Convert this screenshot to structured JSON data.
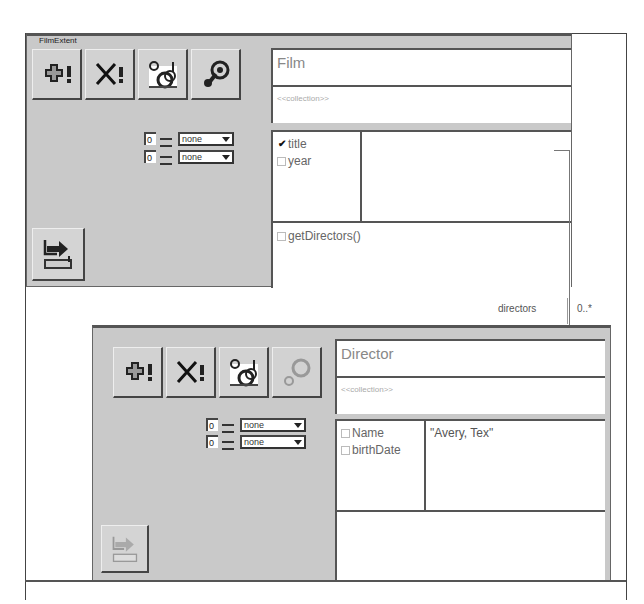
{
  "film_panel": {
    "title": "FilmExtent",
    "toolbar": [
      {
        "name": "add-instance",
        "icon": "plus-exclaim-icon"
      },
      {
        "name": "delete-instance",
        "icon": "x-exclaim-icon"
      },
      {
        "name": "navigate-links",
        "icon": "circles-link-icon"
      },
      {
        "name": "run-method",
        "icon": "gear-icon"
      }
    ],
    "spinners": [
      {
        "value": "0",
        "option": "none"
      },
      {
        "value": "0",
        "option": "none"
      }
    ],
    "class_name": "Film",
    "stereotype": "<<collection>>",
    "attributes": [
      {
        "label": "title",
        "checked": true
      },
      {
        "label": "year",
        "checked": false
      }
    ],
    "attribute_value": "",
    "methods": [
      {
        "label": "getDirectors()",
        "checked": false
      }
    ],
    "bottom_button_icon": "export-icon"
  },
  "association": {
    "role": "directors",
    "multiplicity": "0..*"
  },
  "director_panel": {
    "toolbar": [
      {
        "name": "add-instance",
        "icon": "plus-exclaim-icon"
      },
      {
        "name": "delete-instance",
        "icon": "x-exclaim-icon"
      },
      {
        "name": "navigate-links",
        "icon": "circles-link-icon"
      },
      {
        "name": "run-method",
        "icon": "gear-icon",
        "disabled": true
      }
    ],
    "spinners": [
      {
        "value": "0",
        "option": "none"
      },
      {
        "value": "0",
        "option": "none"
      }
    ],
    "class_name": "Director",
    "stereotype": "<<collection>>",
    "attributes": [
      {
        "label": "Name",
        "checked": false
      },
      {
        "label": "birthDate",
        "checked": false
      }
    ],
    "attribute_value": "\"Avery, Tex\"",
    "methods": [],
    "bottom_button_icon": "export-icon",
    "bottom_button_disabled": true
  }
}
